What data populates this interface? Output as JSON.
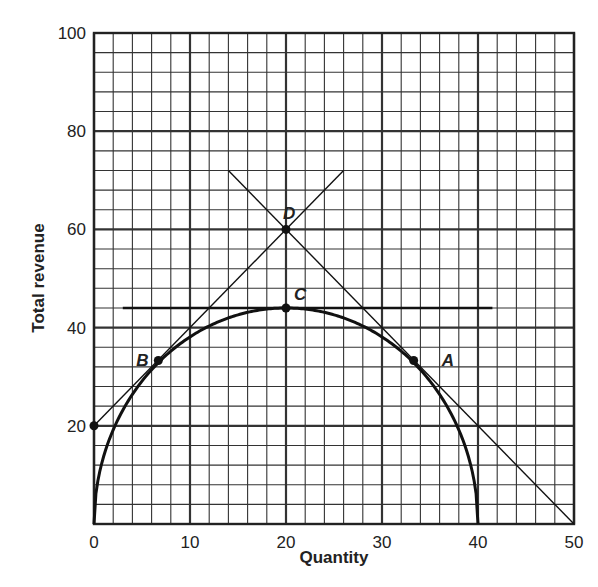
{
  "chart_data": {
    "type": "line",
    "title": "",
    "xlabel": "Quantity",
    "ylabel": "Total revenue",
    "xlim": [
      0,
      50
    ],
    "ylim": [
      0,
      100
    ],
    "x_ticks": [
      0,
      10,
      20,
      30,
      40,
      50
    ],
    "y_ticks": [
      20,
      40,
      60,
      80,
      100
    ],
    "x_tick_labels": [
      "0",
      "10",
      "20",
      "30",
      "40",
      "50"
    ],
    "y_tick_labels": [
      "20",
      "40",
      "60",
      "80",
      "100"
    ],
    "grid": {
      "on": true,
      "minor_x_step": 2,
      "minor_y_step": 4,
      "major_x_step": 10,
      "major_y_step": 20
    },
    "series": [
      {
        "name": "Total revenue curve",
        "type": "curve",
        "description": "dome-shaped curve from (0,0) peaking at (20,44) back to (40,0)",
        "x": [
          0,
          2,
          4,
          6.67,
          10,
          14,
          20,
          26,
          30,
          33.33,
          36,
          38,
          40
        ],
        "values": [
          0,
          19.2,
          26.4,
          32.8,
          38.1,
          42.0,
          44,
          42.0,
          38.1,
          32.8,
          26.4,
          19.2,
          0
        ]
      },
      {
        "name": "Tangent at B",
        "type": "line",
        "x": [
          0,
          26
        ],
        "values": [
          20,
          72
        ]
      },
      {
        "name": "Tangent at A",
        "type": "line",
        "x": [
          14,
          50
        ],
        "values": [
          72,
          0
        ]
      },
      {
        "name": "Tangent at C",
        "type": "line",
        "x": [
          3,
          41.5
        ],
        "values": [
          44,
          44
        ]
      }
    ],
    "points": [
      {
        "label": "A",
        "x": 33.3,
        "y": 33.3
      },
      {
        "label": "B",
        "x": 6.7,
        "y": 33.3
      },
      {
        "label": "C",
        "x": 20,
        "y": 44
      },
      {
        "label": "D",
        "x": 20,
        "y": 60
      },
      {
        "label": "",
        "x": 0,
        "y": 20
      }
    ],
    "legend": null
  }
}
